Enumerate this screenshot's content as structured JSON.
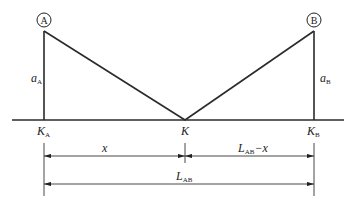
{
  "diagram": {
    "points": {
      "A": {
        "label": "A"
      },
      "B": {
        "label": "B"
      }
    },
    "heights": {
      "a_A": {
        "main": "a",
        "sub": "A"
      },
      "a_B": {
        "main": "a",
        "sub": "B"
      }
    },
    "ground_points": {
      "K_A": {
        "main": "K",
        "sub": "A"
      },
      "K": {
        "main": "K",
        "sub": ""
      },
      "K_B": {
        "main": "K",
        "sub": "B"
      }
    },
    "dimensions": {
      "x": {
        "main": "x",
        "sub": ""
      },
      "L_minus_x": {
        "main": "L",
        "sub": "AB",
        "suffix": "−x"
      },
      "L_AB": {
        "main": "L",
        "sub": "AB"
      }
    }
  }
}
